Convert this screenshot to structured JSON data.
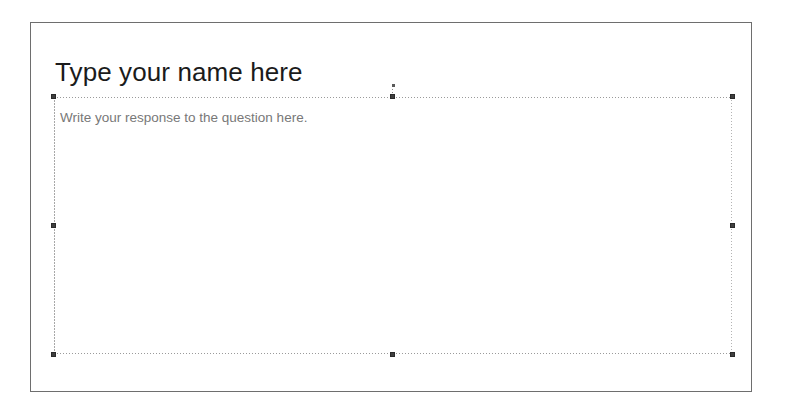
{
  "slide": {
    "title_placeholder": {
      "text": "Type your name here"
    },
    "body_placeholder": {
      "prompt_text": "Write your response to the question here.",
      "selected": true,
      "handles": [
        "top-left",
        "top-center",
        "top-right",
        "middle-left",
        "middle-right",
        "bottom-left",
        "bottom-center",
        "bottom-right"
      ]
    }
  },
  "colors": {
    "page_border": "#6e6e6e",
    "title_text": "#1b1b1b",
    "prompt_text": "#787878",
    "selection_outline": "#9a9a9a",
    "handle_fill": "#3f3f3f",
    "background": "#ffffff"
  }
}
